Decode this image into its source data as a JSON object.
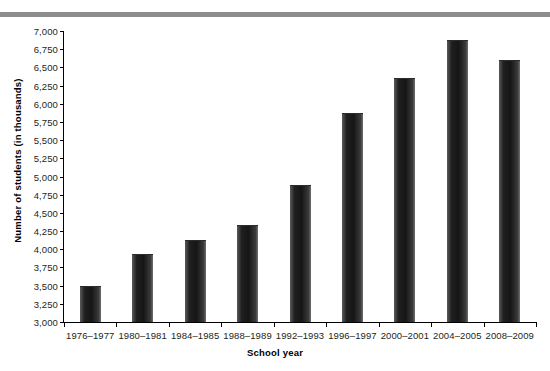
{
  "chart_data": {
    "type": "bar",
    "title": "",
    "xlabel": "School year",
    "ylabel": "Number of students (in thousands)",
    "categories": [
      "1976–1977",
      "1980–1981",
      "1984–1985",
      "1988–1989",
      "1992–1993",
      "1996–1997",
      "2000–2001",
      "2004–2005",
      "2008–2009"
    ],
    "values": [
      3490,
      3940,
      4130,
      4330,
      4880,
      5870,
      6350,
      6870,
      6600
    ],
    "ylim": [
      3000,
      7000
    ],
    "ytick_step": 250,
    "ytick_labels": [
      "7,000",
      "6,750",
      "6,500",
      "6,250",
      "6,000",
      "5,750",
      "5,500",
      "5,250",
      "5,000",
      "4,750",
      "4,500",
      "4,250",
      "4,000",
      "3,750",
      "3,500",
      "3,250",
      "3,000"
    ],
    "ytick_values": [
      7000,
      6750,
      6500,
      6250,
      6000,
      5750,
      5500,
      5250,
      5000,
      4750,
      4500,
      4250,
      4000,
      3750,
      3500,
      3250,
      3000
    ],
    "grid": false,
    "legend": false,
    "bar_color": "#1f1f1f",
    "axis_color": "#000000",
    "text_color": "#231f20",
    "banner_color": "#8d8d8d"
  }
}
